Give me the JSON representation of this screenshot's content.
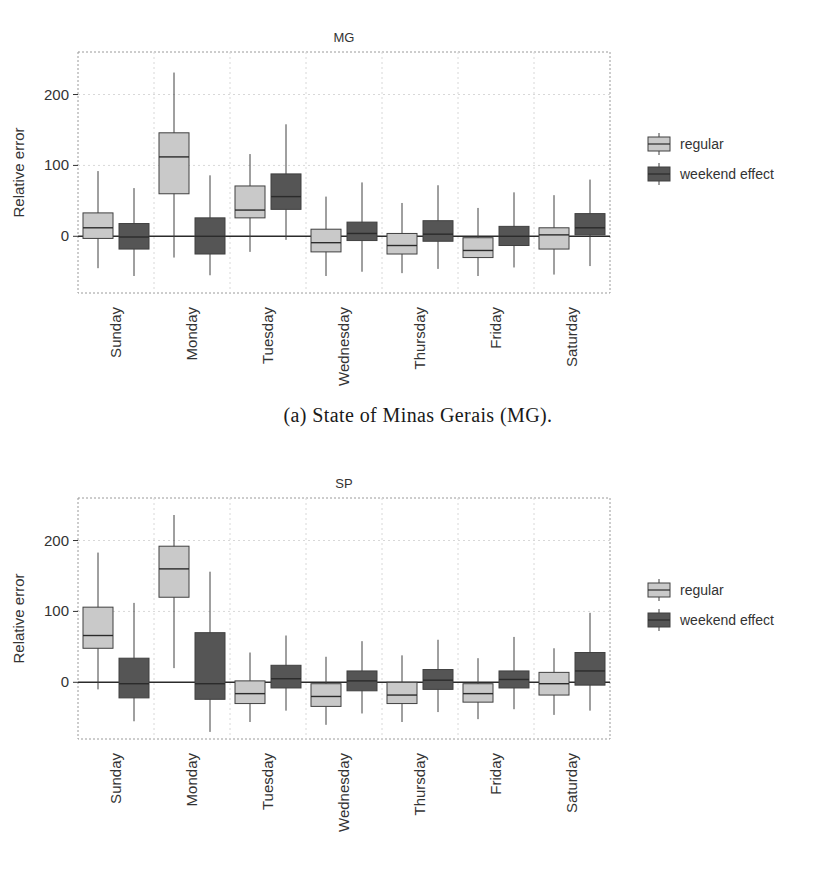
{
  "figure": {
    "captions": {
      "a": "(a) State of Minas Gerais (MG).",
      "b": "(b) State of São Paulo (SP)"
    }
  },
  "legend": {
    "position": "right",
    "items": [
      {
        "label": "regular",
        "color": "#c9c9c9"
      },
      {
        "label": "weekend effect",
        "color": "#555555"
      }
    ]
  },
  "colors": {
    "regular": "#c9c9c9",
    "weekend": "#555555",
    "stroke": "#404040",
    "frame": "#9a9a9a",
    "grid": "#d8d8d8",
    "zeroline": "#2b2b2b",
    "text": "#333333"
  },
  "axes": {
    "ylabel": "Relative error",
    "xlabel": "Day of the week",
    "yticks": [
      0,
      100,
      200
    ],
    "ylim": [
      -80,
      260
    ],
    "grid": true
  },
  "chart_data": [
    {
      "type": "box",
      "id": "mg",
      "title": "MG",
      "xlabel": "Day of the week",
      "ylabel": "Relative error",
      "ylim": [
        -80,
        260
      ],
      "yticks": [
        0,
        100,
        200
      ],
      "categories": [
        "Sunday",
        "Monday",
        "Tuesday",
        "Wednesday",
        "Thursday",
        "Friday",
        "Saturday"
      ],
      "series": [
        {
          "name": "regular",
          "color": "#c9c9c9",
          "boxes": [
            {
              "category": "Sunday",
              "whisker_low": -45,
              "q1": -3,
              "median": 12,
              "q3": 33,
              "whisker_high": 92
            },
            {
              "category": "Monday",
              "whisker_low": -30,
              "q1": 60,
              "median": 112,
              "q3": 146,
              "whisker_high": 231
            },
            {
              "category": "Tuesday",
              "whisker_low": -22,
              "q1": 26,
              "median": 37,
              "q3": 71,
              "whisker_high": 116
            },
            {
              "category": "Wednesday",
              "whisker_low": -56,
              "q1": -22,
              "median": -9,
              "q3": 10,
              "whisker_high": 56
            },
            {
              "category": "Thursday",
              "whisker_low": -52,
              "q1": -25,
              "median": -13,
              "q3": 4,
              "whisker_high": 47
            },
            {
              "category": "Friday",
              "whisker_low": -56,
              "q1": -30,
              "median": -20,
              "q3": -2,
              "whisker_high": 40
            },
            {
              "category": "Saturday",
              "whisker_low": -54,
              "q1": -18,
              "median": 2,
              "q3": 12,
              "whisker_high": 58
            }
          ]
        },
        {
          "name": "weekend effect",
          "color": "#555555",
          "boxes": [
            {
              "category": "Sunday",
              "whisker_low": -56,
              "q1": -18,
              "median": -1,
              "q3": 18,
              "whisker_high": 68
            },
            {
              "category": "Monday",
              "whisker_low": -55,
              "q1": -25,
              "median": 0,
              "q3": 26,
              "whisker_high": 86
            },
            {
              "category": "Tuesday",
              "whisker_low": -5,
              "q1": 38,
              "median": 56,
              "q3": 88,
              "whisker_high": 158
            },
            {
              "category": "Wednesday",
              "whisker_low": -50,
              "q1": -6,
              "median": 4,
              "q3": 20,
              "whisker_high": 76
            },
            {
              "category": "Thursday",
              "whisker_low": -46,
              "q1": -7,
              "median": 3,
              "q3": 22,
              "whisker_high": 72
            },
            {
              "category": "Friday",
              "whisker_low": -44,
              "q1": -13,
              "median": 0,
              "q3": 14,
              "whisker_high": 62
            },
            {
              "category": "Saturday",
              "whisker_low": -42,
              "q1": 2,
              "median": 12,
              "q3": 32,
              "whisker_high": 80
            }
          ]
        }
      ]
    },
    {
      "type": "box",
      "id": "sp",
      "title": "SP",
      "xlabel": "Day of the week",
      "ylabel": "Relative error",
      "ylim": [
        -80,
        260
      ],
      "yticks": [
        0,
        100,
        200
      ],
      "categories": [
        "Sunday",
        "Monday",
        "Tuesday",
        "Wednesday",
        "Thursday",
        "Friday",
        "Saturday"
      ],
      "series": [
        {
          "name": "regular",
          "color": "#c9c9c9",
          "boxes": [
            {
              "category": "Sunday",
              "whisker_low": -10,
              "q1": 48,
              "median": 66,
              "q3": 106,
              "whisker_high": 183
            },
            {
              "category": "Monday",
              "whisker_low": 20,
              "q1": 120,
              "median": 160,
              "q3": 192,
              "whisker_high": 236
            },
            {
              "category": "Tuesday",
              "whisker_low": -56,
              "q1": -30,
              "median": -16,
              "q3": 2,
              "whisker_high": 42
            },
            {
              "category": "Wednesday",
              "whisker_low": -60,
              "q1": -34,
              "median": -20,
              "q3": -2,
              "whisker_high": 36
            },
            {
              "category": "Thursday",
              "whisker_low": -56,
              "q1": -30,
              "median": -18,
              "q3": 0,
              "whisker_high": 38
            },
            {
              "category": "Friday",
              "whisker_low": -52,
              "q1": -28,
              "median": -16,
              "q3": -2,
              "whisker_high": 34
            },
            {
              "category": "Saturday",
              "whisker_low": -46,
              "q1": -18,
              "median": -2,
              "q3": 14,
              "whisker_high": 48
            }
          ]
        },
        {
          "name": "weekend effect",
          "color": "#555555",
          "boxes": [
            {
              "category": "Sunday",
              "whisker_low": -55,
              "q1": -22,
              "median": -2,
              "q3": 34,
              "whisker_high": 112
            },
            {
              "category": "Monday",
              "whisker_low": -70,
              "q1": -24,
              "median": -2,
              "q3": 70,
              "whisker_high": 156
            },
            {
              "category": "Tuesday",
              "whisker_low": -40,
              "q1": -8,
              "median": 5,
              "q3": 24,
              "whisker_high": 66
            },
            {
              "category": "Wednesday",
              "whisker_low": -44,
              "q1": -12,
              "median": 2,
              "q3": 16,
              "whisker_high": 58
            },
            {
              "category": "Thursday",
              "whisker_low": -42,
              "q1": -10,
              "median": 3,
              "q3": 18,
              "whisker_high": 60
            },
            {
              "category": "Friday",
              "whisker_low": -38,
              "q1": -8,
              "median": 4,
              "q3": 16,
              "whisker_high": 64
            },
            {
              "category": "Saturday",
              "whisker_low": -40,
              "q1": -4,
              "median": 16,
              "q3": 42,
              "whisker_high": 98
            }
          ]
        }
      ]
    }
  ]
}
